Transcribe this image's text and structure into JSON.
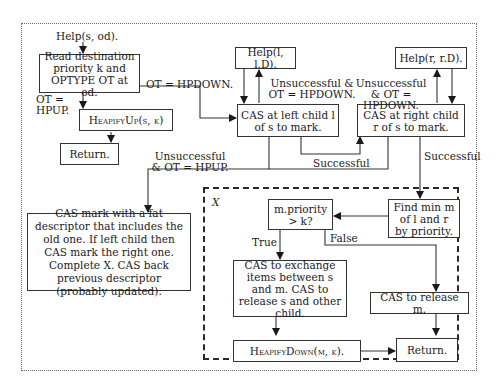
{
  "diagram": {
    "type": "flowchart",
    "entry_label": "Help(s, od).",
    "nodes": {
      "read_dest": "Read destination priority k and OPTYPE OT at od.",
      "heapify_up": "HeapifyUp(s, k)",
      "return_top": "Return.",
      "help_left": "Help(l, l.D).",
      "help_right": "Help(r, r.D).",
      "cas_left": "CAS at left child l of s to mark.",
      "cas_right": "CAS at right child r of s to mark.",
      "fat_descriptor": "CAS mark with a fat descriptor that includes the old one. If left child then CAS mark the right one. Complete X. CAS back previous descriptor (probably updated).",
      "find_min": "Find min m of l and r by priority.",
      "priority_check": "m.priority > k?",
      "cas_exchange": "CAS to exchange items between s and m. CAS to release s and other child.",
      "cas_release_m": "CAS to release m.",
      "heapify_down": "HeapifyDown(m, k).",
      "return_bottom": "Return."
    },
    "edge_labels": {
      "ot_hpup": "OT = HPUP.",
      "ot_hpdown": "OT = HPDOWN.",
      "unsucc_left": "Unsuccessful & OT = HPDOWN.",
      "unsucc_right": "Unsuccessful & OT = HPDOWN.",
      "unsucc_hpup": "Unsuccessful & OT = HPUP.",
      "successful_left": "Successful",
      "successful_right": "Successful",
      "true": "True",
      "false": "False"
    },
    "region_label": "X",
    "edges": [
      {
        "from": "entry",
        "to": "read_dest"
      },
      {
        "from": "read_dest",
        "to": "heapify_up",
        "label": "OT = HPUP."
      },
      {
        "from": "read_dest",
        "to": "cas_left",
        "label": "OT = HPDOWN."
      },
      {
        "from": "heapify_up",
        "to": "return_top"
      },
      {
        "from": "help_left",
        "to": "cas_left"
      },
      {
        "from": "cas_left",
        "to": "help_left",
        "label": "Unsuccessful & OT = HPDOWN."
      },
      {
        "from": "help_right",
        "to": "cas_right"
      },
      {
        "from": "cas_right",
        "to": "help_right",
        "label": "Unsuccessful & OT = HPDOWN."
      },
      {
        "from": "cas_left",
        "to": "cas_right",
        "label": "Successful"
      },
      {
        "from": "cas_left",
        "to": "fat_descriptor",
        "label": "Unsuccessful & OT = HPUP."
      },
      {
        "from": "cas_right",
        "to": "fat_descriptor"
      },
      {
        "from": "cas_right",
        "to": "find_min",
        "label": "Successful"
      },
      {
        "from": "find_min",
        "to": "priority_check"
      },
      {
        "from": "priority_check",
        "to": "cas_exchange",
        "label": "True"
      },
      {
        "from": "priority_check",
        "to": "cas_release_m",
        "label": "False"
      },
      {
        "from": "cas_exchange",
        "to": "heapify_down"
      },
      {
        "from": "heapify_down",
        "to": "return_bottom"
      },
      {
        "from": "cas_release_m",
        "to": "return_bottom"
      }
    ]
  }
}
